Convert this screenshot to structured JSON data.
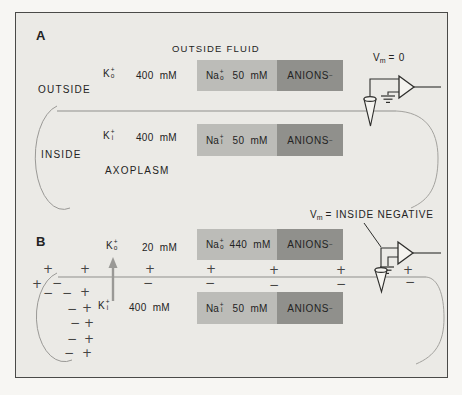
{
  "colors": {
    "panel_background": "#ebeae6",
    "na_box": "#bcbcb8",
    "anions_box": "#90908c",
    "membrane_line": "#8f8f8c",
    "ink": "#232323",
    "arrow_gray": "#9a9996"
  },
  "panelA": {
    "label": "A",
    "outside_fluid_title": "OUTSIDE FLUID",
    "outside_label": "OUTSIDE",
    "inside_label": "INSIDE",
    "axoplasm_label": "AXOPLASM",
    "voltmeter": {
      "v": "V",
      "sub": "m",
      "eq": "= 0"
    },
    "k_outside": {
      "element": "K",
      "sup": "+",
      "sub": "o",
      "value": "400 mM"
    },
    "k_inside": {
      "element": "K",
      "sup": "+",
      "sub": "i",
      "value": "400 mM"
    },
    "na_outside": {
      "element": "Na",
      "sup": "+",
      "sub": "o",
      "value": "50 mM"
    },
    "na_inside": {
      "element": "Na",
      "sup": "+",
      "sub": "i",
      "value": "50 mM"
    },
    "anions_outside": {
      "label": "ANIONS",
      "sup": "−"
    },
    "anions_inside": {
      "label": "ANIONS",
      "sup": "−"
    }
  },
  "panelB": {
    "label": "B",
    "voltmeter": {
      "v": "V",
      "sub": "m",
      "eq": "= INSIDE NEGATIVE"
    },
    "k_outside": {
      "element": "K",
      "sup": "+",
      "sub": "o",
      "value": "20 mM"
    },
    "k_inside": {
      "element": "K",
      "sup": "+",
      "sub": "i",
      "value": "400 mM"
    },
    "na_outside": {
      "element": "Na",
      "sup": "+",
      "sub": "o",
      "value": "440 mM"
    },
    "na_inside": {
      "element": "Na",
      "sup": "+",
      "sub": "i",
      "value": "50 mM"
    },
    "anions_outside": {
      "label": "ANIONS",
      "sup": "−"
    },
    "anions_inside": {
      "label": "ANIONS",
      "sup": "−"
    },
    "membrane_charges": [
      {
        "x": 48,
        "y": 269,
        "s": "+"
      },
      {
        "x": 85,
        "y": 269,
        "s": "+"
      },
      {
        "x": 150,
        "y": 269,
        "s": "+"
      },
      {
        "x": 211,
        "y": 269,
        "s": "+"
      },
      {
        "x": 274,
        "y": 270,
        "s": "+"
      },
      {
        "x": 341,
        "y": 270,
        "s": "+"
      },
      {
        "x": 408,
        "y": 270,
        "s": "+"
      },
      {
        "x": 148,
        "y": 283,
        "s": "−"
      },
      {
        "x": 210,
        "y": 283,
        "s": "−"
      },
      {
        "x": 274,
        "y": 285,
        "s": "−"
      },
      {
        "x": 341,
        "y": 284,
        "s": "−"
      },
      {
        "x": 410,
        "y": 282,
        "s": "−"
      }
    ],
    "end_charges": [
      {
        "x": 37,
        "y": 284,
        "s": "+"
      },
      {
        "x": 85,
        "y": 292,
        "s": "+"
      },
      {
        "x": 87,
        "y": 308,
        "s": "+"
      },
      {
        "x": 89,
        "y": 323,
        "s": "+"
      },
      {
        "x": 89,
        "y": 339,
        "s": "+"
      },
      {
        "x": 87,
        "y": 353,
        "s": "+"
      },
      {
        "x": 57,
        "y": 283,
        "s": "−"
      },
      {
        "x": 48,
        "y": 293,
        "s": "−"
      },
      {
        "x": 67,
        "y": 293,
        "s": "−"
      },
      {
        "x": 72,
        "y": 309,
        "s": "−"
      },
      {
        "x": 75,
        "y": 323,
        "s": "−"
      },
      {
        "x": 72,
        "y": 339,
        "s": "−"
      },
      {
        "x": 69,
        "y": 353,
        "s": "−"
      }
    ]
  }
}
